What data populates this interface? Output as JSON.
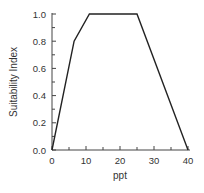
{
  "chart_data": {
    "type": "line",
    "title": "",
    "xlabel": "ppt",
    "ylabel": "Suitability Index",
    "xlim": [
      0,
      40
    ],
    "ylim": [
      0.0,
      1.0
    ],
    "grid": false,
    "legend": null,
    "x_ticks": [
      "0",
      "10",
      "20",
      "30",
      "40"
    ],
    "y_ticks": [
      "0.0",
      "0.2",
      "0.4",
      "0.6",
      "0.8",
      "1.0"
    ],
    "series": [
      {
        "name": "Suitability Index",
        "x": [
          0,
          6.5,
          11,
          25,
          40
        ],
        "y": [
          0.0,
          0.8,
          1.0,
          1.0,
          0.0
        ]
      }
    ]
  }
}
